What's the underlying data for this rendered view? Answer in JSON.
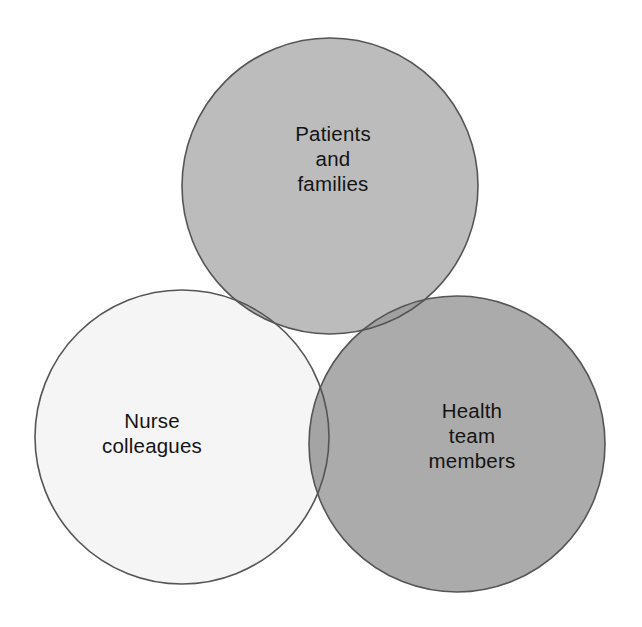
{
  "figure": {
    "kind": "venn-diagram",
    "title": "",
    "background_color": "#ffffff",
    "width": 642,
    "height": 627
  },
  "style": {
    "stroke_color": "#555555",
    "stroke_width": 1.6,
    "text_color": "#141414",
    "region_colors": {
      "patients_only": "#bcbcbc",
      "nurse_only": "#f5f5f5",
      "health_only": "#ababab",
      "patients_nurse": "#b5b5b5",
      "patients_health": "#a0a0a0",
      "nurse_health": "#a4a4a4",
      "all_three": "#999999"
    }
  },
  "chart_data": {
    "type": "venn",
    "title": "",
    "sets": [
      {
        "id": "patients",
        "label": "Patients and families",
        "label_lines": [
          "Patients",
          "and",
          "families"
        ],
        "fill": "#bcbcbc",
        "cx": 330,
        "cy": 186,
        "r": 148,
        "label_x": 333,
        "label_y": 141
      },
      {
        "id": "nurse",
        "label": "Nurse colleagues",
        "label_lines": [
          "Nurse",
          "colleagues"
        ],
        "fill": "#f5f5f5",
        "cx": 182,
        "cy": 437,
        "r": 147,
        "label_x": 152,
        "label_y": 428
      },
      {
        "id": "health",
        "label": "Health team members",
        "label_lines": [
          "Health",
          "team",
          "members"
        ],
        "fill": "#ababab",
        "cx": 457,
        "cy": 444,
        "r": 148,
        "label_x": 472,
        "label_y": 418
      }
    ],
    "intersections": [
      {
        "id": "patients-nurse",
        "sets": [
          "patients",
          "nurse"
        ],
        "label": "",
        "fill": "#b5b5b5"
      },
      {
        "id": "patients-health",
        "sets": [
          "patients",
          "health"
        ],
        "label": "",
        "fill": "#a0a0a0"
      },
      {
        "id": "nurse-health",
        "sets": [
          "nurse",
          "health"
        ],
        "label": "",
        "fill": "#a4a4a4"
      },
      {
        "id": "all-three",
        "sets": [
          "patients",
          "nurse",
          "health"
        ],
        "label": "",
        "fill": "#999999"
      }
    ]
  }
}
